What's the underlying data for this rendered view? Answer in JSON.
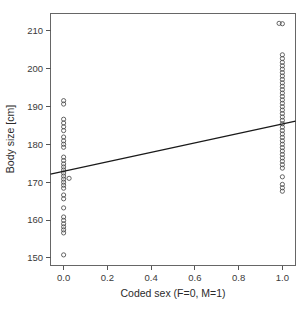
{
  "chart_data": {
    "type": "scatter",
    "title": "",
    "subtitle": "",
    "xlabel": "Coded sex (F=0, M=1)",
    "ylabel": "Body size [cm]",
    "xlim": [
      -0.06,
      1.06
    ],
    "ylim": [
      148.0,
      214.5
    ],
    "xticks": [
      0.0,
      0.2,
      0.4,
      0.6,
      0.8,
      1.0
    ],
    "xtick_labels": [
      "0.0",
      "0.2",
      "0.4",
      "0.6",
      "0.8",
      "1.0"
    ],
    "yticks": [
      150,
      160,
      170,
      180,
      190,
      200,
      210
    ],
    "ytick_labels": [
      "150",
      "160",
      "170",
      "180",
      "190",
      "200",
      "210"
    ],
    "grid": false,
    "legend": null,
    "marker": "open-circle",
    "marker_color": "#4a4a4a",
    "line_color": "#1a1a1a",
    "box": true,
    "series": [
      {
        "name": "Females (coded sex = 0)",
        "x_value": 0.0,
        "values": [
          191.5,
          190.6,
          186.6,
          185.6,
          184.6,
          183.6,
          181.9,
          180.9,
          180.0,
          179.2,
          176.6,
          175.7,
          174.8,
          174.0,
          173.2,
          172.4,
          171.6,
          170.8,
          170.0,
          169.2,
          168.4,
          166.6,
          165.6,
          163.2,
          160.8,
          159.9,
          159.0,
          158.2,
          157.4,
          156.6,
          150.8
        ]
      },
      {
        "name": "Females (jittered)",
        "x_value": 0.025,
        "values": [
          171.0
        ]
      },
      {
        "name": "Males (coded sex = 1)",
        "x_value": 1.0,
        "values": [
          211.8,
          203.6,
          202.6,
          201.6,
          200.7,
          199.8,
          198.9,
          198.0,
          197.1,
          196.2,
          195.3,
          194.4,
          193.5,
          192.6,
          191.7,
          190.8,
          189.9,
          189.0,
          188.1,
          187.2,
          186.3,
          185.4,
          184.5,
          183.6,
          182.7,
          181.8,
          180.9,
          180.0,
          179.1,
          178.2,
          177.3,
          176.4,
          175.5,
          174.6,
          173.7,
          171.4,
          169.4,
          168.5,
          167.6
        ]
      },
      {
        "name": "Males (jittered)",
        "x_value": 0.985,
        "values": [
          211.9
        ]
      }
    ],
    "fit_line": {
      "name": "Linear regression fit",
      "x_start": -0.06,
      "y_start": 172.1,
      "x_end": 1.06,
      "y_end": 186.1,
      "intercept": 172.85,
      "slope": 12.5
    }
  },
  "axis": {
    "x_title": "Coded sex (F=0, M=1)",
    "y_title": "Body size [cm]"
  }
}
